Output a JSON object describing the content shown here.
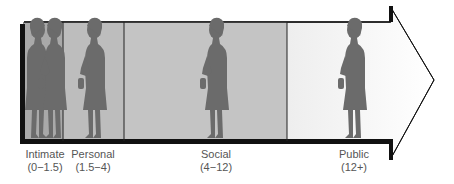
{
  "diagram": {
    "colors": {
      "figure": "#6b6b6b",
      "zone_intimate": "#a9a9a9",
      "zone_personal": "#bdbdbd",
      "zone_social": "#c4c4c4",
      "zone_public_start": "#cfcfcf",
      "arrow_end": "#ffffff",
      "frame": "#111111",
      "label": "#555555"
    },
    "zones": [
      {
        "name": "Intimate",
        "range": "(0−1.5)",
        "figures": 2
      },
      {
        "name": "Personal",
        "range": "(1.5−4)",
        "figures": 1
      },
      {
        "name": "Social",
        "range": "(4−12)",
        "figures": 1
      },
      {
        "name": "Public",
        "range": "(12+)",
        "figures": 1
      }
    ]
  }
}
